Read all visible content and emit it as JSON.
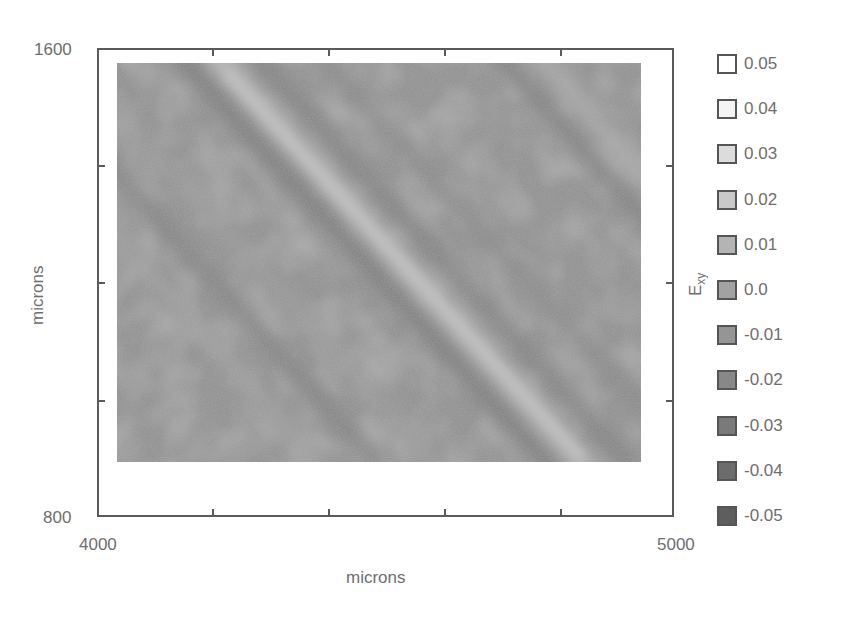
{
  "chart_data": {
    "type": "heatmap",
    "title": "",
    "xlabel": "microns",
    "ylabel": "microns",
    "colorbar_label": "E_xy",
    "xlim": [
      4000,
      5000
    ],
    "ylim": [
      800,
      1600
    ],
    "x_tick_labels": [
      "4000",
      "5000"
    ],
    "y_tick_labels": [
      "1600",
      "800"
    ],
    "x_ticks_minor_count": 4,
    "y_ticks_minor_count": 3,
    "data_extent": {
      "x": [
        4017,
        4935
      ],
      "y": [
        893,
        1575
      ]
    },
    "legend": [
      {
        "value": "0.05",
        "color": "#ffffff"
      },
      {
        "value": "0.04",
        "color": "#f4f4f4"
      },
      {
        "value": "0.03",
        "color": "#dcdcdc"
      },
      {
        "value": "0.02",
        "color": "#c8c8c8"
      },
      {
        "value": "0.01",
        "color": "#b4b4b4"
      },
      {
        "value": "0.0",
        "color": "#a2a2a2"
      },
      {
        "value": "-0.01",
        "color": "#959595"
      },
      {
        "value": "-0.02",
        "color": "#888888"
      },
      {
        "value": "-0.03",
        "color": "#7a7a7a"
      },
      {
        "value": "-0.04",
        "color": "#6c6c6c"
      },
      {
        "value": "-0.05",
        "color": "#5e5e5e"
      }
    ],
    "grid": false,
    "legend_position": "right"
  },
  "axes": {
    "x_min_label": "4000",
    "x_max_label": "5000",
    "y_max_label": "1600",
    "y_min_label": "800",
    "x_title": "microns",
    "y_title": "microns",
    "cbar_title_main": "E",
    "cbar_title_sub": "xy"
  }
}
